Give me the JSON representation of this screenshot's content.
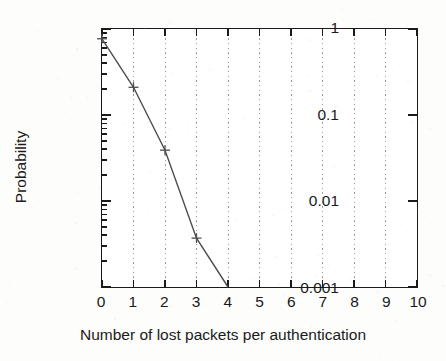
{
  "chart_data": {
    "type": "line",
    "title": "",
    "xlabel": "Number of lost packets per authentication",
    "ylabel": "Probability",
    "yscale": "log",
    "xscale": "linear",
    "xlim": [
      0,
      10
    ],
    "ylim": [
      0.001,
      1
    ],
    "xticks": [
      "0",
      "1",
      "2",
      "3",
      "4",
      "5",
      "6",
      "7",
      "8",
      "9",
      "10"
    ],
    "xtick_values": [
      0,
      1,
      2,
      3,
      4,
      5,
      6,
      7,
      8,
      9,
      10
    ],
    "yticks": [
      "1",
      "0.1",
      "0.01",
      "0.001"
    ],
    "ytick_values": [
      1,
      0.1,
      0.01,
      0.001
    ],
    "grid": "vertical-dotted-at-x-integers",
    "legend": "none",
    "marker": "plus",
    "line_color": "#4d4d4d",
    "frame_color": "#1a1a1a",
    "grid_color": "#9a9a9a",
    "x": [
      0,
      1,
      2,
      3,
      4
    ],
    "values": [
      0.77,
      0.21,
      0.039,
      0.0037,
      0.001
    ],
    "series": [
      {
        "name": "probability of lost packets",
        "x": [
          0,
          1,
          2,
          3,
          4
        ],
        "values": [
          0.77,
          0.21,
          0.039,
          0.0037,
          0.001
        ]
      }
    ],
    "minor_ytick_multipliers": [
      2,
      3,
      4,
      5,
      6,
      7,
      8,
      9
    ]
  }
}
